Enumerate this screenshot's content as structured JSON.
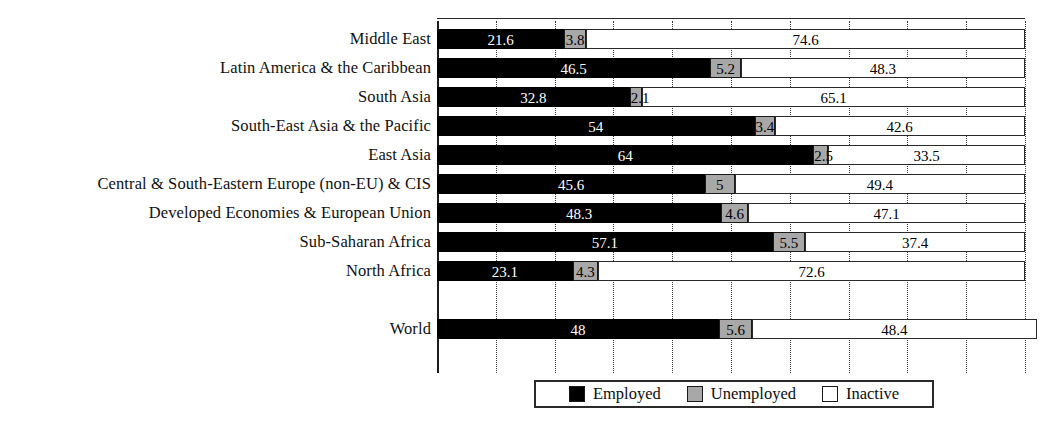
{
  "chart_data": {
    "type": "bar",
    "subtype": "stacked-horizontal-100pct",
    "title": "",
    "xlabel": "",
    "ylabel": "",
    "xlim": [
      0,
      100
    ],
    "grid": true,
    "grid_interval": 10,
    "legend_position": "bottom",
    "orientation": "horizontal",
    "stacked": true,
    "categories": [
      "Middle East",
      "Latin America & the Caribbean",
      "South Asia",
      "South-East Asia & the Pacific",
      "East Asia",
      "Central & South-Eastern Europe (non-EU) & CIS",
      "Developed Economies & European Union",
      "Sub-Saharan Africa",
      "North Africa",
      "",
      "World"
    ],
    "series": [
      {
        "name": "Employed",
        "color": "#000000",
        "values": [
          21.6,
          46.5,
          32.8,
          54,
          64,
          45.6,
          48.3,
          57.1,
          23.1,
          null,
          48
        ]
      },
      {
        "name": "Unemployed",
        "color": "#a8a8a8",
        "values": [
          3.8,
          5.2,
          2.1,
          3.4,
          2.5,
          5,
          4.6,
          5.5,
          4.3,
          null,
          5.6
        ]
      },
      {
        "name": "Inactive",
        "color": "#ffffff",
        "values": [
          74.6,
          48.3,
          65.1,
          42.6,
          33.5,
          49.4,
          47.1,
          37.4,
          72.6,
          null,
          48.4
        ]
      }
    ],
    "value_labels": {
      "Middle East": [
        "21.6",
        "3.8",
        "74.6"
      ],
      "Latin America & the Caribbean": [
        "46.5",
        "5.2",
        "48.3"
      ],
      "South Asia": [
        "32.8",
        "2.1",
        "65.1"
      ],
      "South-East Asia & the Pacific": [
        "54",
        "3.4",
        "42.6"
      ],
      "East Asia": [
        "64",
        "2.5",
        "33.5"
      ],
      "Central & South-Eastern Europe (non-EU) & CIS": [
        "45.6",
        "5",
        "49.4"
      ],
      "Developed Economies & European Union": [
        "48.3",
        "4.6",
        "47.1"
      ],
      "Sub-Saharan Africa": [
        "57.1",
        "5.5",
        "37.4"
      ],
      "North Africa": [
        "23.1",
        "4.3",
        "72.6"
      ],
      "World": [
        "48",
        "5.6",
        "48.4"
      ]
    }
  },
  "rows": [
    {
      "label": "Middle East",
      "employed": "21.6",
      "unemployed": "3.8",
      "inactive": "74.6"
    },
    {
      "label": "Latin America & the Caribbean",
      "employed": "46.5",
      "unemployed": "5.2",
      "inactive": "48.3"
    },
    {
      "label": "South Asia",
      "employed": "32.8",
      "unemployed": "2.1",
      "inactive": "65.1"
    },
    {
      "label": "South-East Asia & the Pacific",
      "employed": "54",
      "unemployed": "3.4",
      "inactive": "42.6"
    },
    {
      "label": "East Asia",
      "employed": "64",
      "unemployed": "2.5",
      "inactive": "33.5"
    },
    {
      "label": "Central & South-Eastern Europe (non-EU) & CIS",
      "employed": "45.6",
      "unemployed": "5",
      "inactive": "49.4"
    },
    {
      "label": "Developed Economies & European Union",
      "employed": "48.3",
      "unemployed": "4.6",
      "inactive": "47.1"
    },
    {
      "label": "Sub-Saharan Africa",
      "employed": "57.1",
      "unemployed": "5.5",
      "inactive": "37.4"
    },
    {
      "label": "North Africa",
      "employed": "23.1",
      "unemployed": "4.3",
      "inactive": "72.6"
    },
    {
      "label": "World",
      "employed": "48",
      "unemployed": "5.6",
      "inactive": "48.4"
    }
  ],
  "legend": {
    "items": [
      {
        "label": "Employed",
        "color": "#000000"
      },
      {
        "label": "Unemployed",
        "color": "#a8a8a8"
      },
      {
        "label": "Inactive",
        "color": "#ffffff"
      }
    ]
  },
  "colors": {
    "employed": "#000000",
    "unemployed": "#a8a8a8",
    "inactive": "#ffffff",
    "axis": "#1c1c1c",
    "grid": "#3a3a3a",
    "text": "#101010"
  }
}
